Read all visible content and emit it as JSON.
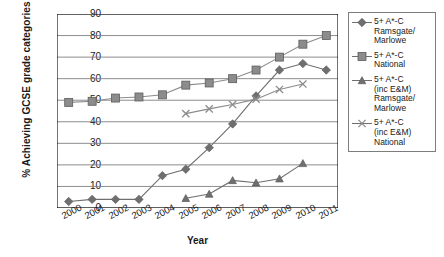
{
  "chart_data": {
    "type": "line",
    "title": "",
    "xlabel": "Year",
    "ylabel": "% Achieving GCSE grade categories",
    "categories": [
      "2000",
      "2001",
      "2002",
      "2003",
      "2004",
      "2005",
      "2006",
      "2007",
      "2008",
      "2009",
      "2010",
      "2011"
    ],
    "ylim": [
      0,
      90
    ],
    "ytick_step": 10,
    "yticks": [
      "90",
      "80",
      "70",
      "60",
      "50",
      "40",
      "30",
      "20",
      "10",
      "0"
    ],
    "grid": "horizontal",
    "legend_position": "right",
    "series": [
      {
        "name": "5+ A*-C\nRamsgate/\nMarlowe",
        "marker": "diamond",
        "color": "#6f6f6f",
        "values": [
          3,
          4,
          4,
          4,
          15,
          18,
          28,
          39,
          52,
          64,
          67,
          64
        ]
      },
      {
        "name": "5+ A*-C\nNational",
        "marker": "square",
        "color": "#8c8c8c",
        "values": [
          49,
          49.5,
          51,
          51.5,
          52.5,
          57,
          58,
          60,
          64,
          70,
          76,
          80
        ]
      },
      {
        "name": "5+ A*-C\n(inc E&M)\nRamsgate/\nMarlowe",
        "marker": "triangle",
        "color": "#6f6f6f",
        "values": [
          null,
          null,
          null,
          null,
          null,
          4.5,
          6.5,
          12.8,
          11.7,
          13.6,
          20.7,
          null
        ]
      },
      {
        "name": "5+ A*-C\n(inc E&M)\nNational",
        "marker": "cross",
        "color": "#8c8c8c",
        "values": [
          null,
          null,
          null,
          null,
          null,
          43.8,
          46,
          48,
          50.5,
          55,
          57.5,
          null
        ]
      }
    ]
  },
  "axes": {
    "frame_color": "#000000",
    "grid_color": "#808080"
  }
}
